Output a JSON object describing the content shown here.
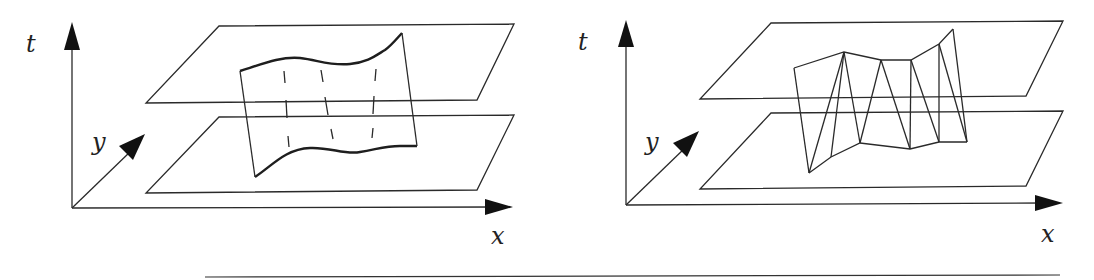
{
  "figure": {
    "type": "diagram",
    "panels": [
      {
        "id": "left",
        "axes": {
          "t_label": "t",
          "y_label": "y",
          "x_label": "x"
        },
        "planes": [
          "upper-time-slice",
          "lower-time-slice"
        ],
        "surface": "smooth curved sheet with dashed vertical interior lines"
      },
      {
        "id": "right",
        "axes": {
          "t_label": "t",
          "y_label": "y",
          "x_label": "x"
        },
        "planes": [
          "upper-time-slice",
          "lower-time-slice"
        ],
        "surface": "triangulated strip (piecewise-linear mesh)"
      }
    ],
    "colors": {
      "line": "#2a2a2a",
      "background": "#ffffff"
    }
  }
}
